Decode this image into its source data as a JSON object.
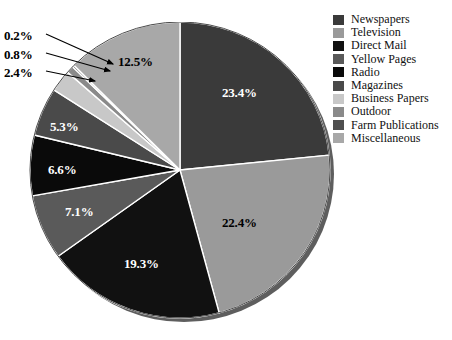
{
  "chart_data": {
    "type": "pie",
    "title": "",
    "xlabel": "",
    "ylabel": "",
    "legend_position": "right",
    "grid": false,
    "start_angle_deg": 0,
    "direction": "clockwise",
    "categories": [
      "Newspapers",
      "Television",
      "Direct Mail",
      "Yellow Pages",
      "Radio",
      "Magazines",
      "Business Papers",
      "Outdoor",
      "Farm Publications",
      "Miscellaneous"
    ],
    "values": [
      23.4,
      22.4,
      19.3,
      7.1,
      6.6,
      5.3,
      2.4,
      0.8,
      0.2,
      12.5
    ],
    "value_labels": [
      "23.4%",
      "22.4%",
      "19.3%",
      "7.1%",
      "6.6%",
      "5.3%",
      "2.4%",
      "0.8%",
      "0.2%",
      "12.5%"
    ],
    "colors": [
      "#3a3a3a",
      "#9a9a9a",
      "#111111",
      "#5a5a5a",
      "#0a0a0a",
      "#4a4a4a",
      "#c8c8c8",
      "#8a8a8a",
      "#4f4f4f",
      "#a8a8a8"
    ],
    "units": "percent",
    "total": 100.0
  },
  "legend": {
    "items": [
      {
        "label": "Newspapers",
        "color": "#3a3a3a"
      },
      {
        "label": "Television",
        "color": "#9a9a9a"
      },
      {
        "label": "Direct Mail",
        "color": "#111111"
      },
      {
        "label": "Yellow Pages",
        "color": "#5a5a5a"
      },
      {
        "label": "Radio",
        "color": "#0a0a0a"
      },
      {
        "label": "Magazines",
        "color": "#4a4a4a"
      },
      {
        "label": "Business Papers",
        "color": "#c8c8c8"
      },
      {
        "label": "Outdoor",
        "color": "#8a8a8a"
      },
      {
        "label": "Farm Publications",
        "color": "#4f4f4f"
      },
      {
        "label": "Miscellaneous",
        "color": "#a8a8a8"
      }
    ]
  },
  "slice_labels": {
    "inner": [
      {
        "text": "23.4%",
        "x": 222,
        "y": 85,
        "tone": "light"
      },
      {
        "text": "22.4%",
        "x": 222,
        "y": 215,
        "tone": "dark"
      },
      {
        "text": "19.3%",
        "x": 124,
        "y": 256,
        "tone": "light"
      },
      {
        "text": "7.1%",
        "x": 65,
        "y": 204,
        "tone": "light"
      },
      {
        "text": "6.6%",
        "x": 48,
        "y": 162,
        "tone": "light"
      },
      {
        "text": "5.3%",
        "x": 50,
        "y": 119,
        "tone": "light"
      },
      {
        "text": "12.5%",
        "x": 118,
        "y": 54,
        "tone": "dark"
      }
    ],
    "callouts": [
      {
        "text": "0.2%",
        "x": 4,
        "y": 28,
        "line": {
          "x1": 46,
          "y1": 34,
          "x2": 113,
          "y2": 64
        }
      },
      {
        "text": "0.8%",
        "x": 4,
        "y": 47,
        "line": {
          "x1": 46,
          "y1": 53,
          "x2": 110,
          "y2": 71
        }
      },
      {
        "text": "2.4%",
        "x": 4,
        "y": 65,
        "line": {
          "x1": 46,
          "y1": 71,
          "x2": 95,
          "y2": 81
        }
      }
    ]
  },
  "geometry": {
    "center_x": 154,
    "center_y": 148,
    "radius_x": 150,
    "radius_y": 148,
    "shadow_offset": 4
  }
}
